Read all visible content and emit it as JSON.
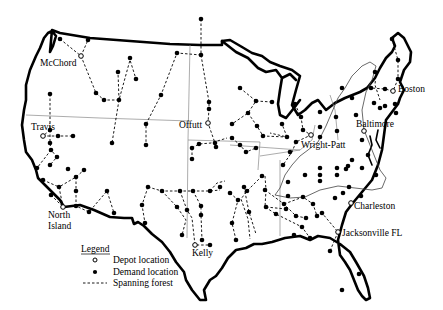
{
  "map": {
    "depots": [
      {
        "name": "McChord",
        "x": 81,
        "y": 56,
        "label_x": 40,
        "label_y": 66
      },
      {
        "name": "Travis",
        "x": 43,
        "y": 136,
        "label_x": 31,
        "label_y": 130
      },
      {
        "name": "Offutt",
        "x": 208,
        "y": 123,
        "label_x": 179,
        "label_y": 128
      },
      {
        "name": "Wright-Patt",
        "x": 311,
        "y": 135,
        "label_x": 302,
        "label_y": 148
      },
      {
        "name": "Baltimore",
        "x": 364,
        "y": 131,
        "label_x": 356,
        "label_y": 127
      },
      {
        "name": "Boston",
        "x": 393,
        "y": 91,
        "label_x": 398,
        "label_y": 92
      },
      {
        "name": "North Island",
        "x": 63,
        "y": 207,
        "label_x": 48,
        "label_y": 217,
        "label2": "Island",
        "label1": "North"
      },
      {
        "name": "Kelly",
        "x": 195,
        "y": 245,
        "label_x": 192,
        "label_y": 255
      },
      {
        "name": "Charleston",
        "x": 351,
        "y": 203,
        "label_x": 354,
        "label_y": 208
      },
      {
        "name": "Jacksonville FL",
        "x": 338,
        "y": 232,
        "label_x": 342,
        "label_y": 235
      }
    ],
    "labels": {
      "mcchord": "McChord",
      "travis": "Travis",
      "offutt": "Offutt",
      "wright_patt": "Wright-Patt",
      "baltimore": "Baltimore",
      "boston": "Boston",
      "north": "North",
      "island": "Island",
      "kelly": "Kelly",
      "charleston": "Charleston",
      "jacksonville": "Jacksonville FL"
    }
  },
  "legend": {
    "title": "Legend",
    "items": [
      {
        "symbol": "open-circle",
        "label": "Depot location"
      },
      {
        "symbol": "filled-circle",
        "label": "Demand location"
      },
      {
        "symbol": "dashed-line",
        "label": "Spanning forest"
      }
    ]
  }
}
